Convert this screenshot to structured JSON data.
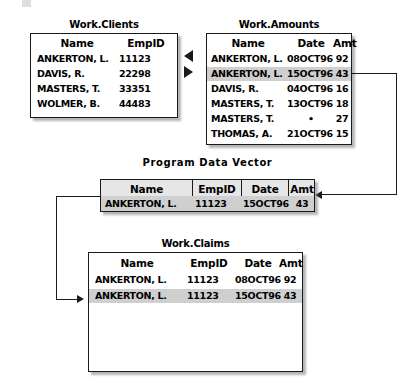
{
  "diagram": {
    "title_artifact": "",
    "tables": {
      "clients": {
        "title": "Work.Clients",
        "columns": [
          "Name",
          "EmpID"
        ],
        "rows": [
          {
            "name": "ANKERTON, L.",
            "empid": "11123",
            "highlighted": false
          },
          {
            "name": "DAVIS, R.",
            "empid": "22298",
            "highlighted": false
          },
          {
            "name": "MASTERS, T.",
            "empid": "33351",
            "highlighted": false
          },
          {
            "name": "WOLMER, B.",
            "empid": "44483",
            "highlighted": false
          }
        ]
      },
      "amounts": {
        "title": "Work.Amounts",
        "columns": [
          "Name",
          "Date",
          "Amt"
        ],
        "rows": [
          {
            "name": "ANKERTON, L.",
            "date": "08OCT96",
            "amt": "92",
            "highlighted": false
          },
          {
            "name": "ANKERTON, L.",
            "date": "15OCT96",
            "amt": "43",
            "highlighted": true
          },
          {
            "name": "DAVIS, R.",
            "date": "04OCT96",
            "amt": "16",
            "highlighted": false
          },
          {
            "name": "MASTERS, T.",
            "date": "13OCT96",
            "amt": "18",
            "highlighted": false
          },
          {
            "name": "MASTERS, T.",
            "date": "•",
            "amt": "27",
            "highlighted": false
          },
          {
            "name": "THOMAS, A.",
            "date": "21OCT96",
            "amt": "15",
            "highlighted": false
          }
        ]
      },
      "pdv": {
        "title": "Program Data Vector",
        "columns": [
          "Name",
          "EmpID",
          "Date",
          "Amt"
        ],
        "rows": [
          {
            "name": "ANKERTON, L.",
            "empid": "11123",
            "date": "15OCT96",
            "amt": "43",
            "highlighted": true
          }
        ]
      },
      "claims": {
        "title": "Work.Claims",
        "columns": [
          "Name",
          "EmpID",
          "Date",
          "Amt"
        ],
        "rows": [
          {
            "name": "ANKERTON, L.",
            "empid": "11123",
            "date": "08OCT96",
            "amt": "92",
            "highlighted": false
          },
          {
            "name": "ANKERTON, L.",
            "empid": "11123",
            "date": "15OCT96",
            "amt": "43",
            "highlighted": true
          }
        ]
      }
    },
    "colors": {
      "highlight_row": "#cfcfcf",
      "header_fill": "#e6e6e6",
      "border": "#1a1a1a",
      "background": "#ffffff"
    }
  }
}
